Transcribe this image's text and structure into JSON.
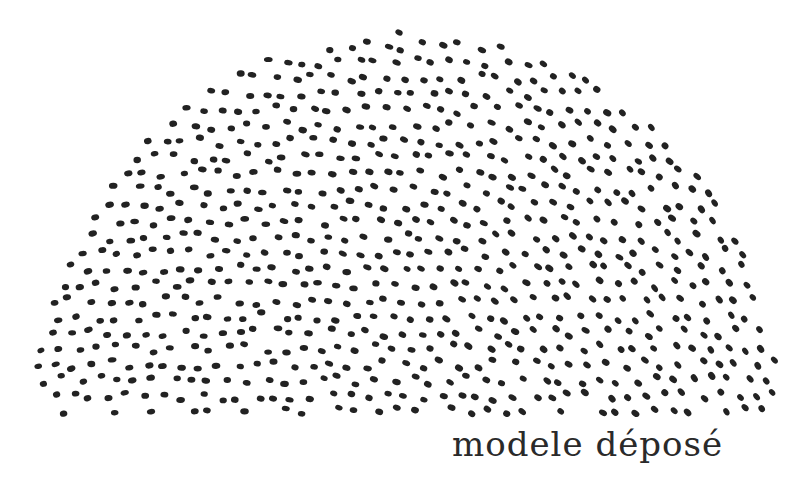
{
  "figure": {
    "dot_color": "#222222",
    "background_color": "#ffffff"
  },
  "caption": {
    "text": "modele déposé"
  }
}
